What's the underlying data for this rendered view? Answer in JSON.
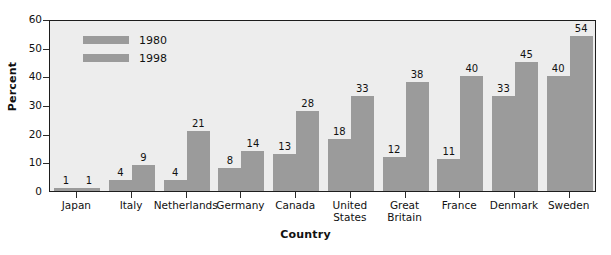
{
  "chart_data": {
    "type": "bar",
    "title": "",
    "subtitle": "",
    "xlabel": "Country",
    "ylabel": "Percent",
    "categories": [
      "Japan",
      "Italy",
      "Netherlands",
      "Germany",
      "Canada",
      "United States",
      "Great Britain",
      "France",
      "Denmark",
      "Sweden"
    ],
    "series": [
      {
        "name": "1980",
        "values": [
          1,
          4,
          4,
          8,
          13,
          18,
          12,
          11,
          33,
          40
        ]
      },
      {
        "name": "1998",
        "values": [
          1,
          9,
          21,
          14,
          28,
          33,
          38,
          40,
          45,
          54
        ]
      }
    ],
    "ylim": [
      0,
      60
    ],
    "y_ticks": [
      0,
      10,
      20,
      30,
      40,
      50,
      60
    ],
    "grid": false,
    "legend_position": "top-left-inside",
    "data_labels": true,
    "colors": {
      "bar": "#9b9b9b",
      "plot_background": "#ededed",
      "plot_border": "#1d1d1d",
      "text": "#111111",
      "figure_background": "#ffffff"
    }
  },
  "legend": {
    "entries": [
      {
        "label": "1980",
        "swatch_name": "legend-swatch-1980"
      },
      {
        "label": "1998",
        "swatch_name": "legend-swatch-1998"
      }
    ]
  },
  "axes": {
    "y_title": "Percent",
    "x_title": "Country",
    "y_tick_labels": [
      "60",
      "50",
      "40",
      "30",
      "20",
      "10",
      "0"
    ],
    "x_tick_labels": [
      "Japan",
      "Italy",
      "Netherlands",
      "Germany",
      "Canada",
      "United States",
      "Great Britain",
      "France",
      "Denmark",
      "Sweden"
    ]
  }
}
